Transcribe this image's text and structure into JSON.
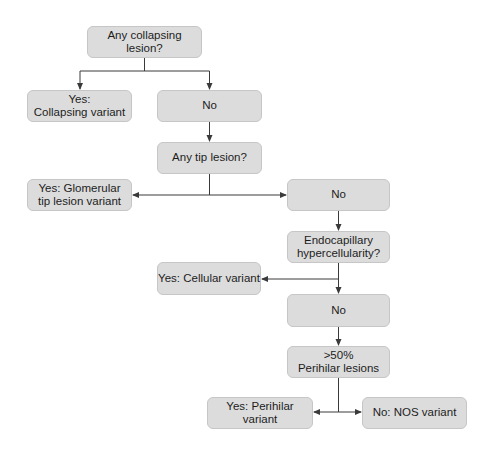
{
  "flowchart": {
    "nodes": {
      "q_collapsing": "Any collapsing lesion?",
      "yes_collapsing": "Yes:\nCollapsing variant",
      "no_1": "No",
      "q_tip": "Any tip lesion?",
      "yes_tip": "Yes: Glomerular\ntip lesion variant",
      "no_2": "No",
      "q_endocapillary": "Endocapillary\nhypercellularity?",
      "yes_cellular": "Yes: Cellular variant",
      "no_3": "No",
      "q_perihilar": ">50%\nPerihilar lesions",
      "yes_perihilar": "Yes: Perihilar variant",
      "no_nos": "No: NOS variant"
    },
    "edges": [
      {
        "from": "q_collapsing",
        "to": "yes_collapsing"
      },
      {
        "from": "q_collapsing",
        "to": "no_1"
      },
      {
        "from": "no_1",
        "to": "q_tip"
      },
      {
        "from": "q_tip",
        "to": "yes_tip"
      },
      {
        "from": "q_tip",
        "to": "no_2"
      },
      {
        "from": "no_2",
        "to": "q_endocapillary"
      },
      {
        "from": "q_endocapillary",
        "to": "yes_cellular"
      },
      {
        "from": "q_endocapillary",
        "to": "no_3"
      },
      {
        "from": "no_3",
        "to": "q_perihilar"
      },
      {
        "from": "q_perihilar",
        "to": "yes_perihilar"
      },
      {
        "from": "q_perihilar",
        "to": "no_nos"
      }
    ],
    "colors": {
      "node_fill": "#dcdcdc",
      "node_border": "#c6c6c6",
      "line": "#3a3a3a",
      "text": "#1c1c1c"
    }
  }
}
